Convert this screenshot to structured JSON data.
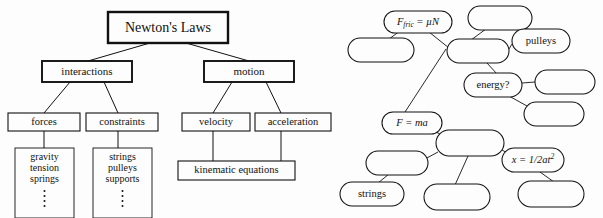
{
  "figure": {
    "ink_color": "#111111",
    "background_color": "#fdfdfd"
  },
  "left_diagram": {
    "name": "hierarchical-tree",
    "root": {
      "label": "Newton's Laws"
    },
    "level1": [
      {
        "label": "interactions"
      },
      {
        "label": "motion"
      }
    ],
    "level2": [
      {
        "label": "forces"
      },
      {
        "label": "constraints"
      },
      {
        "label": "velocity"
      },
      {
        "label": "acceleration"
      }
    ],
    "leaves": [
      {
        "name": "forces-examples",
        "items": [
          "gravity",
          "tension",
          "springs"
        ],
        "ellipsis": "⋮"
      },
      {
        "name": "constraints-examples",
        "items": [
          "strings",
          "pulleys",
          "supports"
        ],
        "ellipsis": "⋮"
      },
      {
        "name": "kinematic-equations",
        "items": [
          "kinematic equations"
        ],
        "ellipsis": ""
      }
    ]
  },
  "right_diagram": {
    "name": "associative-concept-web",
    "nodes": [
      {
        "id": "f-fric",
        "label": "F_fric = μN",
        "label_parts": {
          "base": "F",
          "sub": "fric",
          "rest": " = μN"
        },
        "styled": "italic-math",
        "x": 418,
        "y": 22,
        "rx": 34,
        "ry": 11
      },
      {
        "id": "blank-1",
        "label": "",
        "x": 381,
        "y": 50,
        "rx": 33,
        "ry": 12
      },
      {
        "id": "blank-2",
        "label": "",
        "x": 500,
        "y": 18,
        "rx": 32,
        "ry": 12
      },
      {
        "id": "pulleys",
        "label": "pulleys",
        "x": 541,
        "y": 41,
        "rx": 29,
        "ry": 12
      },
      {
        "id": "blank-3",
        "label": "",
        "x": 478,
        "y": 51,
        "rx": 31,
        "ry": 12
      },
      {
        "id": "energy",
        "label": "energy?",
        "x": 493,
        "y": 85,
        "rx": 29,
        "ry": 12
      },
      {
        "id": "blank-4",
        "label": "",
        "x": 565,
        "y": 82,
        "rx": 30,
        "ry": 12
      },
      {
        "id": "blank-5",
        "label": "",
        "x": 554,
        "y": 114,
        "rx": 30,
        "ry": 12
      },
      {
        "id": "f-ma",
        "label": "F = ma",
        "styled": "italic-math",
        "x": 412,
        "y": 123,
        "rx": 30,
        "ry": 11
      },
      {
        "id": "blank-6",
        "label": "",
        "x": 470,
        "y": 143,
        "rx": 34,
        "ry": 13
      },
      {
        "id": "blank-7",
        "label": "",
        "x": 397,
        "y": 163,
        "rx": 31,
        "ry": 12
      },
      {
        "id": "x-half-at2",
        "label": "x = 1/2at²",
        "label_parts": {
          "base": "x = 1/2at",
          "sup": "2"
        },
        "styled": "italic-math",
        "x": 533,
        "y": 160,
        "rx": 31,
        "ry": 12
      },
      {
        "id": "strings",
        "label": "strings",
        "x": 372,
        "y": 194,
        "rx": 32,
        "ry": 12
      },
      {
        "id": "blank-8",
        "label": "",
        "x": 457,
        "y": 197,
        "rx": 33,
        "ry": 13
      },
      {
        "id": "blank-9",
        "label": "",
        "x": 551,
        "y": 194,
        "rx": 33,
        "ry": 13
      }
    ],
    "edges": [
      {
        "from": "f-fric",
        "to": "blank-1"
      },
      {
        "from": "f-fric",
        "to": "blank-3"
      },
      {
        "from": "blank-3",
        "to": "f-ma"
      },
      {
        "from": "blank-2",
        "to": "blank-3"
      },
      {
        "from": "blank-2",
        "to": "pulleys"
      },
      {
        "from": "pulleys",
        "to": "blank-3"
      },
      {
        "from": "blank-3",
        "to": "energy"
      },
      {
        "from": "energy",
        "to": "blank-4"
      },
      {
        "from": "energy",
        "to": "blank-5"
      },
      {
        "from": "f-ma",
        "to": "blank-6"
      },
      {
        "from": "blank-6",
        "to": "blank-7"
      },
      {
        "from": "blank-7",
        "to": "strings"
      },
      {
        "from": "blank-6",
        "to": "blank-8"
      },
      {
        "from": "blank-6",
        "to": "x-half-at2"
      },
      {
        "from": "x-half-at2",
        "to": "blank-9"
      }
    ]
  }
}
